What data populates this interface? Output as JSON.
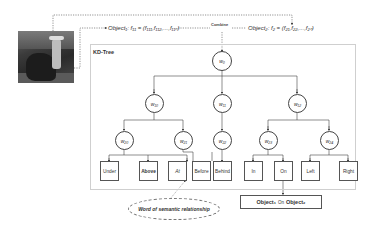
{
  "image": {
    "subject": "cowboy-on-horse-photo"
  },
  "top": {
    "object1_formula": "Object₁: f₁₁ = (f₁₁₁,f₁₁₂,...,f₁₁ₙ)",
    "object2_formula": "Object₂: f₂ = (f₂₁,f₂₂,...,f₂ₙ)",
    "combine_label": "Combine"
  },
  "kdtree": {
    "title": "KD-Tree",
    "root": "w₀",
    "level1": [
      "w₁₀",
      "w₁₁",
      "w₁₂"
    ],
    "level2": [
      "w₂₀",
      "w₂₁",
      "w₂₂",
      "w₂₃",
      "w₂₄"
    ],
    "leaves": [
      "Under",
      "Above",
      "At",
      "Before",
      "Behind",
      "In",
      "On",
      "Left",
      "Right"
    ]
  },
  "annotation": {
    "label": "Word of semantic relationship"
  },
  "result": {
    "left": "Object₁",
    "middle": "On",
    "right": "Object₂"
  },
  "colors": {
    "line": "#444444",
    "box_border": "#cfcfcf",
    "background": "#ffffff"
  }
}
